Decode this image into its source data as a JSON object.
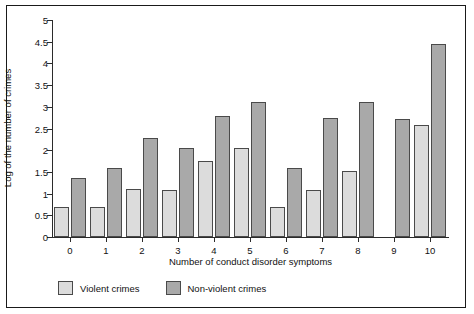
{
  "chart_data": {
    "type": "bar",
    "title": "",
    "xlabel": "Number of conduct disorder symptoms",
    "ylabel": "Log of the number of crimes",
    "categories": [
      "0",
      "1",
      "2",
      "3",
      "4",
      "5",
      "6",
      "7",
      "8",
      "9",
      "10"
    ],
    "ylim": [
      0,
      5
    ],
    "yticks": [
      "0",
      "0.5",
      "1",
      "1.5",
      "2",
      "2.5",
      "3",
      "3.5",
      "4",
      "4.5",
      "5"
    ],
    "grid": false,
    "legend_position": "bottom-left",
    "series": [
      {
        "name": "Violent crimes",
        "color": "#dcdcdc",
        "values": [
          0.7,
          0.7,
          1.1,
          1.08,
          1.75,
          2.05,
          0.7,
          1.08,
          1.52,
          null,
          2.58
        ]
      },
      {
        "name": "Non-violent crimes",
        "color": "#a9a9a9",
        "values": [
          1.37,
          1.6,
          2.27,
          2.05,
          2.78,
          3.12,
          1.58,
          2.75,
          3.1,
          2.73,
          4.45
        ]
      }
    ]
  },
  "legend": {
    "violent_label": "Violent crimes",
    "nonviolent_label": "Non-violent crimes"
  }
}
